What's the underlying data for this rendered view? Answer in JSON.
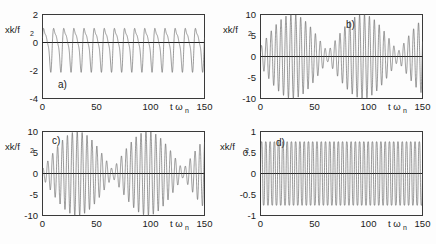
{
  "figure": {
    "background_color": "#fdfdfd",
    "curve_color": "#555555",
    "axis_color": "#3a3a3a",
    "panel_count": 4
  },
  "chart_data": [
    {
      "type": "line",
      "panel_label": "a)",
      "title": "",
      "xlabel": "t ω",
      "xlabel_sub": "n",
      "ylabel": "xk/f",
      "ylabel_sub": "2",
      "xlim": [
        0,
        150
      ],
      "ylim": [
        -4,
        2
      ],
      "xticks": [
        0,
        50,
        100,
        150
      ],
      "xticklabels": [
        "0",
        "50",
        "100",
        "150"
      ],
      "yticks": [
        2,
        0,
        -2,
        -4
      ],
      "yticklabels": [
        "2",
        "0",
        "-2",
        "-4"
      ],
      "grid": false,
      "legend": "none",
      "description": "Asymmetric periodic oscillation, positive peaks near 1.5-1.8, sharp negative troughs near -2.0, about 16 cycles over t=0..150",
      "waveform": {
        "kind": "asymmetric-relaxation",
        "cycles": 16,
        "pos_peak": 1.75,
        "neg_peak": -2.05,
        "mean": -0.15
      }
    },
    {
      "type": "line",
      "panel_label": "b)",
      "title": "",
      "xlabel": "t ω",
      "xlabel_sub": "n",
      "ylabel": "xk/f",
      "ylabel_sub": "2",
      "xlim": [
        0,
        150
      ],
      "ylim": [
        -10,
        10
      ],
      "xticks": [
        0,
        50,
        100,
        150
      ],
      "xticklabels": [
        "0",
        "50",
        "100",
        "150"
      ],
      "yticks": [
        10,
        5,
        0,
        -5,
        -10
      ],
      "yticklabels": [
        "10",
        "5",
        "0",
        "-5",
        "-10"
      ],
      "grid": false,
      "legend": "none",
      "description": "Amplitude-modulated beating oscillation, envelope maxima near t=30 and t=95 reaching +/-10, envelope minima near t=5, t=62 and t=125",
      "waveform": {
        "kind": "beating",
        "carrier_cycles": 33,
        "beat_cycles": 2.3,
        "max_amp": 10.0,
        "min_amp": 1.2
      }
    },
    {
      "type": "line",
      "panel_label": "c)",
      "title": "",
      "xlabel": "t ω",
      "xlabel_sub": "n",
      "ylabel": "xk/f",
      "ylabel_sub": "2",
      "xlim": [
        0,
        150
      ],
      "ylim": [
        -10,
        10
      ],
      "xticks": [
        0,
        50,
        100,
        150
      ],
      "xticklabels": [
        "0",
        "50",
        "100",
        "150"
      ],
      "yticks": [
        10,
        5,
        0,
        -5,
        -10
      ],
      "yticklabels": [
        "10",
        "5",
        "0",
        "-5",
        "-10"
      ],
      "grid": false,
      "legend": "none",
      "description": "Amplitude-modulated beating oscillation similar to panel b, envelope maxima near t=32 and t=97 reaching +/-10, envelope minima near t=3, t=65 and t=128",
      "waveform": {
        "kind": "beating",
        "carrier_cycles": 33,
        "beat_cycles": 2.3,
        "max_amp": 10.0,
        "min_amp": 1.0
      }
    },
    {
      "type": "line",
      "panel_label": "d)",
      "title": "",
      "xlabel": "t ω",
      "xlabel_sub": "n",
      "ylabel": "xk/f",
      "ylabel_sub": "2",
      "xlim": [
        0,
        150
      ],
      "ylim": [
        -1,
        1
      ],
      "xticks": [
        0,
        50,
        100,
        150
      ],
      "xticklabels": [
        "0",
        "50",
        "100",
        "150"
      ],
      "yticks": [
        1,
        0.5,
        0,
        -0.5,
        -1
      ],
      "yticklabels": [
        "1",
        "0.5",
        "0",
        "-0.5",
        "-1"
      ],
      "grid": false,
      "legend": "none",
      "description": "High-frequency constant-amplitude oscillation filling the band -0.9 to +0.9 uniformly across the whole record",
      "waveform": {
        "kind": "uniform-highfreq",
        "cycles": 38,
        "amplitude": 0.9
      }
    }
  ]
}
